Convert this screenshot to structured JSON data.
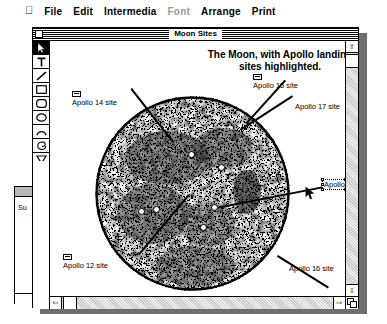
{
  "menubar": {
    "apple_icon": "apple-icon",
    "items": [
      {
        "label": "File",
        "enabled": true
      },
      {
        "label": "Edit",
        "enabled": true
      },
      {
        "label": "Intermedia",
        "enabled": true
      },
      {
        "label": "Font",
        "enabled": false
      },
      {
        "label": "Arrange",
        "enabled": true
      },
      {
        "label": "Print",
        "enabled": true
      }
    ]
  },
  "background_window": {
    "visible_text": "Su"
  },
  "document_window": {
    "title": "Moon Sites",
    "close_box": "close-box",
    "heading": "The Moon, with Apollo landing sites highlighted."
  },
  "palette": {
    "tools": [
      {
        "name": "pointer-tool",
        "icon": "arrow-icon",
        "selected": true
      },
      {
        "name": "text-tool",
        "icon": "text-t-icon",
        "selected": false
      },
      {
        "name": "line-tool",
        "icon": "line-icon",
        "selected": false
      },
      {
        "name": "rectangle-tool",
        "icon": "rectangle-icon",
        "selected": false
      },
      {
        "name": "rounded-rectangle-tool",
        "icon": "rounded-rectangle-icon",
        "selected": false
      },
      {
        "name": "oval-tool",
        "icon": "oval-icon",
        "selected": false
      },
      {
        "name": "arc-tool",
        "icon": "arc-icon",
        "selected": false
      },
      {
        "name": "freehand-tool",
        "icon": "freehand-icon",
        "selected": false
      },
      {
        "name": "polygon-tool",
        "icon": "polygon-icon",
        "selected": false
      }
    ]
  },
  "sites": [
    {
      "id": "apollo14",
      "label": "Apollo 14 site",
      "selected": false
    },
    {
      "id": "apollo15",
      "label": "Apollo 15 site",
      "selected": false
    },
    {
      "id": "apollo17",
      "label": "Apollo 17 site",
      "selected": false
    },
    {
      "id": "apollo11",
      "label": "Apollo 11 site",
      "selected": true
    },
    {
      "id": "apollo12",
      "label": "Apollo 12 site",
      "selected": false
    },
    {
      "id": "apollo16",
      "label": "Apollo 16 site",
      "selected": false
    }
  ],
  "scrollbars": {
    "up_arrow": "⇧",
    "down_arrow": "⇩",
    "left_arrow": "⇦",
    "right_arrow": "⇨"
  },
  "colors": {
    "desktop": "#ffffff",
    "window_shadow": "#6e6e6e",
    "ink": "#000000",
    "dim_text": "#9a9a9a",
    "scroll_track": "#e0e0e0"
  },
  "cursor": {
    "icon": "arrow-pointer-icon",
    "x": 305,
    "y": 186
  }
}
